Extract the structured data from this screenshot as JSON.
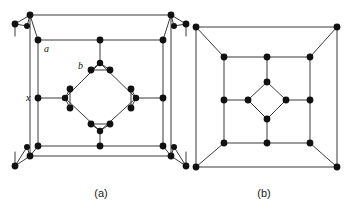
{
  "figure": {
    "background_color": "#ffffff",
    "line_color": "#3a3a3a",
    "node_color": "#111111",
    "width": 351,
    "height": 210,
    "type": "crystal-unit-cell-diagram",
    "panels": [
      {
        "id": "a",
        "caption": "(a)",
        "caption_x": 101,
        "caption_y": 197,
        "description": "Unit cell projection with triangular three-atom clusters at the eight outer corners, an inner square, and a central diamond whose four vertices carry paired atoms.",
        "outer_square": {
          "x0": 30,
          "y0": 15,
          "x1": 171,
          "y1": 156
        },
        "inner_square": {
          "x0": 38,
          "y0": 40,
          "x1": 163,
          "y1": 146
        },
        "labels": [
          {
            "text": "a",
            "x": 44,
            "y": 52
          },
          {
            "text": "b",
            "x": 78,
            "y": 69
          },
          {
            "text": "x",
            "x": 26,
            "y": 101
          }
        ],
        "outer_nodes": [
          {
            "x": 30,
            "y": 15
          },
          {
            "x": 171,
            "y": 15
          },
          {
            "x": 30,
            "y": 156
          },
          {
            "x": 171,
            "y": 156
          }
        ],
        "corner_clusters": [
          {
            "cx": 30,
            "cy": 15,
            "dots": [
              [
                15,
                24
              ],
              [
                27,
                26
              ]
            ]
          },
          {
            "cx": 171,
            "cy": 15,
            "dots": [
              [
                174,
                26
              ],
              [
                186,
                24
              ]
            ]
          },
          {
            "cx": 30,
            "cy": 156,
            "dots": [
              [
                15,
                166
              ],
              [
                27,
                147
              ]
            ]
          },
          {
            "cx": 171,
            "cy": 156,
            "dots": [
              [
                174,
                147
              ],
              [
                186,
                166
              ]
            ]
          }
        ],
        "inner_square_nodes": [
          {
            "x": 38,
            "y": 40,
            "role": "corner"
          },
          {
            "x": 100,
            "y": 40,
            "role": "edge-mid-top"
          },
          {
            "x": 163,
            "y": 40,
            "role": "corner"
          },
          {
            "x": 38,
            "y": 98,
            "role": "edge-mid-left"
          },
          {
            "x": 163,
            "y": 98,
            "role": "edge-mid-right"
          },
          {
            "x": 38,
            "y": 146,
            "role": "corner"
          },
          {
            "x": 100,
            "y": 146,
            "role": "edge-mid-bottom"
          },
          {
            "x": 163,
            "y": 146,
            "role": "corner"
          }
        ],
        "diamond": {
          "top": {
            "x": 100,
            "y": 63
          },
          "right": {
            "x": 136,
            "y": 98
          },
          "bottom": {
            "x": 100,
            "y": 131
          },
          "left": {
            "x": 65,
            "y": 98
          }
        },
        "diamond_pairs": [
          {
            "vertex": "top",
            "dots": [
              [
                91,
                70
              ],
              [
                110,
                70
              ]
            ]
          },
          {
            "vertex": "right",
            "dots": [
              [
                131,
                89
              ],
              [
                131,
                108
              ]
            ]
          },
          {
            "vertex": "bottom",
            "dots": [
              [
                91,
                124
              ],
              [
                110,
                124
              ]
            ]
          },
          {
            "vertex": "left",
            "dots": [
              [
                70,
                89
              ],
              [
                70,
                108
              ]
            ]
          }
        ]
      },
      {
        "id": "b",
        "caption": "(b)",
        "caption_x": 264,
        "caption_y": 197,
        "description": "Simplified projection of the same cell: single atoms at outer corners, at inner-square corners and edge midpoints, and four atoms forming a small central diamond.",
        "outer_square": {
          "x0": 196,
          "y0": 27,
          "x1": 337,
          "y1": 167
        },
        "inner_square": {
          "x0": 224,
          "y0": 57,
          "x1": 310,
          "y1": 143
        },
        "outer_nodes": [
          {
            "x": 196,
            "y": 27
          },
          {
            "x": 337,
            "y": 27
          },
          {
            "x": 196,
            "y": 167
          },
          {
            "x": 337,
            "y": 167
          }
        ],
        "inner_square_nodes": [
          {
            "x": 224,
            "y": 57,
            "role": "corner"
          },
          {
            "x": 267,
            "y": 57,
            "role": "edge-mid-top"
          },
          {
            "x": 310,
            "y": 57,
            "role": "corner"
          },
          {
            "x": 224,
            "y": 100,
            "role": "edge-mid-left"
          },
          {
            "x": 310,
            "y": 100,
            "role": "edge-mid-right"
          },
          {
            "x": 224,
            "y": 143,
            "role": "corner"
          },
          {
            "x": 267,
            "y": 143,
            "role": "edge-mid-bottom"
          },
          {
            "x": 310,
            "y": 143,
            "role": "corner"
          }
        ],
        "diamond": {
          "top": {
            "x": 267,
            "y": 82
          },
          "right": {
            "x": 286,
            "y": 100
          },
          "bottom": {
            "x": 267,
            "y": 119
          },
          "left": {
            "x": 248,
            "y": 100
          }
        }
      }
    ]
  }
}
